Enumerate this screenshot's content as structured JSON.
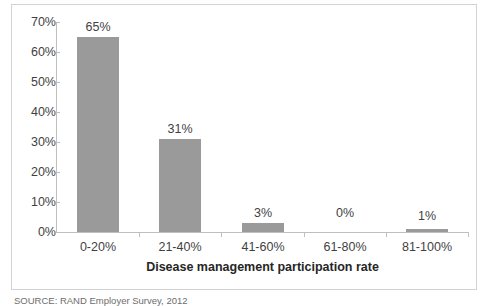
{
  "chart_data": {
    "type": "bar",
    "title": "",
    "subtitle": "",
    "categories": [
      "0-20%",
      "21-40%",
      "41-60%",
      "61-80%",
      "81-100%"
    ],
    "values": [
      65,
      31,
      3,
      0,
      1
    ],
    "data_labels": [
      "65%",
      "31%",
      "3%",
      "0%",
      "1%"
    ],
    "xlabel": "Disease management participation rate",
    "ylabel": "",
    "ylim": [
      0,
      70
    ],
    "ytick_values": [
      0,
      10,
      20,
      30,
      40,
      50,
      60,
      70
    ],
    "ytick_labels": [
      "0%",
      "10%",
      "20%",
      "30%",
      "40%",
      "50%",
      "60%",
      "70%"
    ],
    "grid": false,
    "legend": false,
    "legend_position": "none",
    "bar_color": "#9a9a9a",
    "axis_color": "#bfbfbf",
    "text_color": "#3f3f3f",
    "frame_color": "#d3d3d3",
    "background_color": "#ffffff"
  },
  "notes": {
    "source": "SOURCE: RAND Employer Survey, 2012"
  }
}
